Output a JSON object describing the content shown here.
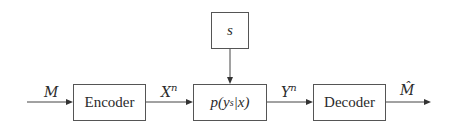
{
  "diagram": {
    "type": "block-diagram",
    "title": "",
    "nodes": [
      {
        "id": "encoder",
        "label": "Encoder"
      },
      {
        "id": "channel",
        "label_prefix": "p(",
        "label_var": "y",
        "label_sub": "s",
        "label_suffix": "|x)"
      },
      {
        "id": "state",
        "label": "s"
      },
      {
        "id": "decoder",
        "label": "Decoder"
      }
    ],
    "edges": [
      {
        "from": "input",
        "to": "encoder",
        "label": "M"
      },
      {
        "from": "encoder",
        "to": "channel",
        "label_base": "X",
        "label_sup": "n"
      },
      {
        "from": "state",
        "to": "channel",
        "label": ""
      },
      {
        "from": "channel",
        "to": "decoder",
        "label_base": "Y",
        "label_sup": "n"
      },
      {
        "from": "decoder",
        "to": "output",
        "label": "M̂"
      }
    ],
    "colors": {
      "stroke": "#555555",
      "text": "#2b2b2b",
      "background": "#ffffff"
    }
  }
}
